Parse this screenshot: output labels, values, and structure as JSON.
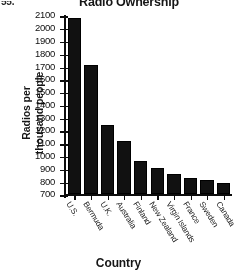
{
  "figure_number": "55.",
  "chart_data": {
    "type": "bar",
    "title": "Radio Ownership",
    "xlabel": "Country",
    "ylabel_lines": [
      "Radios per",
      "thousand people"
    ],
    "ylabel": "Radios per thousand people",
    "categories": [
      "U.S.",
      "Bermuda",
      "U.K.",
      "Australia",
      "Finland",
      "New Zealand",
      "Virgin Islands",
      "France",
      "Sweden",
      "Canada"
    ],
    "values": [
      2080,
      1715,
      1240,
      1120,
      965,
      905,
      860,
      825,
      815,
      790
    ],
    "ylim": [
      700,
      2100
    ],
    "ytick_labels": [
      "700",
      "800",
      "900",
      "1000",
      "1100",
      "1200",
      "1300",
      "1400",
      "1500",
      "1600",
      "1700",
      "1800",
      "1900",
      "2000",
      "2100"
    ],
    "ytick_values": [
      700,
      800,
      900,
      1000,
      1100,
      1200,
      1300,
      1400,
      1500,
      1600,
      1700,
      1800,
      1900,
      2000,
      2100
    ],
    "grid": false,
    "legend": "none",
    "bar_color": "#151515"
  }
}
